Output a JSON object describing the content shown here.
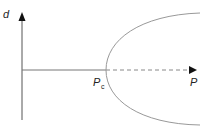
{
  "diagram": {
    "type": "pitchfork-bifurcation",
    "y_axis_label": "d",
    "x_axis_label": "P",
    "critical_point_label": "P",
    "critical_point_subscript": "c",
    "colors": {
      "axis": "#444444",
      "curve": "#888888",
      "stable_branch": "#888888",
      "unstable_branch": "#888888"
    },
    "branches": [
      {
        "name": "trivial-stable",
        "style": "solid",
        "from": "origin",
        "to": "Pc"
      },
      {
        "name": "trivial-unstable",
        "style": "dashed",
        "from": "Pc",
        "to": "P-arrow"
      },
      {
        "name": "upper-branch",
        "style": "solid",
        "shape": "parabola"
      },
      {
        "name": "lower-branch",
        "style": "solid",
        "shape": "parabola"
      }
    ]
  }
}
